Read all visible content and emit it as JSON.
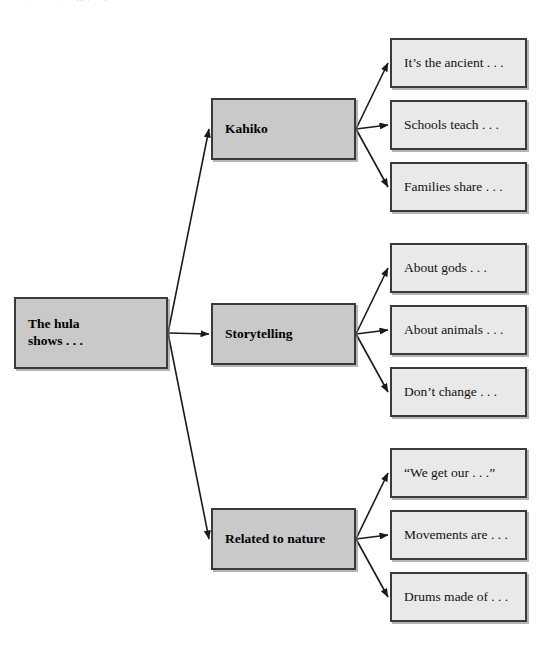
{
  "page": {
    "header_fragment": "Literature, worksheets, reading graphic organizer",
    "background_color": "#ffffff"
  },
  "colors": {
    "branch_fill": "#c9c9c9",
    "leaf_fill": "#e9e9e9",
    "border": "#3a3a3a",
    "arrow": "#1a1a1a"
  },
  "diagram": {
    "type": "tree-graphic-organizer",
    "root": {
      "id": "root",
      "label": "The hula\nshows . . .",
      "x": 14,
      "y": 297,
      "width": 154,
      "height": 72
    },
    "branches": [
      {
        "id": "branch-kahiko",
        "label": "Kahiko",
        "x": 211,
        "y": 98,
        "width": 145,
        "height": 62,
        "leaves": [
          {
            "id": "leaf-ancient",
            "label": "It’s the ancient . . .",
            "x": 390,
            "y": 38,
            "width": 137,
            "height": 50
          },
          {
            "id": "leaf-schools",
            "label": "Schools teach . . .",
            "x": 390,
            "y": 100,
            "width": 137,
            "height": 50
          },
          {
            "id": "leaf-families",
            "label": "Families share . . .",
            "x": 390,
            "y": 162,
            "width": 137,
            "height": 50
          }
        ]
      },
      {
        "id": "branch-storytelling",
        "label": "Storytelling",
        "x": 211,
        "y": 303,
        "width": 145,
        "height": 62,
        "leaves": [
          {
            "id": "leaf-gods",
            "label": "About gods . . .",
            "x": 390,
            "y": 243,
            "width": 137,
            "height": 50
          },
          {
            "id": "leaf-animals",
            "label": "About animals . . .",
            "x": 390,
            "y": 305,
            "width": 137,
            "height": 50
          },
          {
            "id": "leaf-dontchange",
            "label": "Don’t change . . .",
            "x": 390,
            "y": 367,
            "width": 137,
            "height": 50
          }
        ]
      },
      {
        "id": "branch-nature",
        "label": "Related to nature",
        "x": 211,
        "y": 508,
        "width": 145,
        "height": 62,
        "leaves": [
          {
            "id": "leaf-wegetour",
            "label": "“We get our . . .”",
            "x": 390,
            "y": 448,
            "width": 137,
            "height": 50
          },
          {
            "id": "leaf-movements",
            "label": "Movements are . . .",
            "x": 390,
            "y": 510,
            "width": 137,
            "height": 50
          },
          {
            "id": "leaf-drums",
            "label": "Drums made of . . .",
            "x": 390,
            "y": 572,
            "width": 137,
            "height": 50
          }
        ]
      }
    ],
    "connectors": [
      {
        "id": "root-to-kahiko",
        "from": "root",
        "to": "branch-kahiko",
        "x1": 168,
        "y1": 333,
        "x2": 209,
        "y2": 129
      },
      {
        "id": "root-to-storytelling",
        "from": "root",
        "to": "branch-storytelling",
        "x1": 168,
        "y1": 333,
        "x2": 209,
        "y2": 334
      },
      {
        "id": "root-to-nature",
        "from": "root",
        "to": "branch-nature",
        "x1": 168,
        "y1": 333,
        "x2": 209,
        "y2": 539
      },
      {
        "id": "kahiko-to-ancient",
        "from": "branch-kahiko",
        "to": "leaf-ancient",
        "x1": 356,
        "y1": 129,
        "x2": 388,
        "y2": 63
      },
      {
        "id": "kahiko-to-schools",
        "from": "branch-kahiko",
        "to": "leaf-schools",
        "x1": 356,
        "y1": 129,
        "x2": 388,
        "y2": 125
      },
      {
        "id": "kahiko-to-families",
        "from": "branch-kahiko",
        "to": "leaf-families",
        "x1": 356,
        "y1": 129,
        "x2": 388,
        "y2": 187
      },
      {
        "id": "storytelling-to-gods",
        "from": "branch-storytelling",
        "to": "leaf-gods",
        "x1": 356,
        "y1": 334,
        "x2": 388,
        "y2": 268
      },
      {
        "id": "storytelling-to-animals",
        "from": "branch-storytelling",
        "to": "leaf-animals",
        "x1": 356,
        "y1": 334,
        "x2": 388,
        "y2": 330
      },
      {
        "id": "storytelling-to-dontchange",
        "from": "branch-storytelling",
        "to": "leaf-dontchange",
        "x1": 356,
        "y1": 334,
        "x2": 388,
        "y2": 392
      },
      {
        "id": "nature-to-wegetour",
        "from": "branch-nature",
        "to": "leaf-wegetour",
        "x1": 356,
        "y1": 539,
        "x2": 388,
        "y2": 473
      },
      {
        "id": "nature-to-movements",
        "from": "branch-nature",
        "to": "leaf-movements",
        "x1": 356,
        "y1": 539,
        "x2": 388,
        "y2": 535
      },
      {
        "id": "nature-to-drums",
        "from": "branch-nature",
        "to": "leaf-drums",
        "x1": 356,
        "y1": 539,
        "x2": 388,
        "y2": 597
      }
    ]
  }
}
